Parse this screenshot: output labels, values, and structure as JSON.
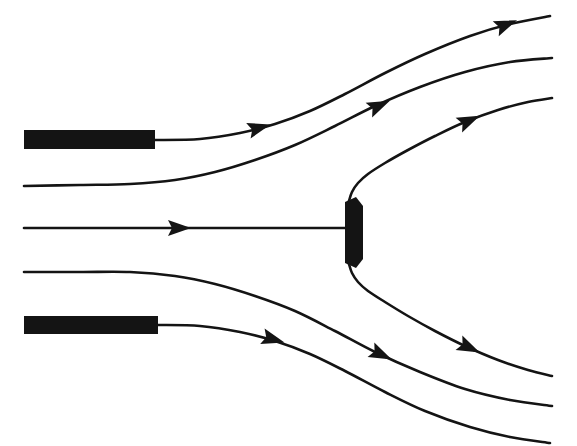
{
  "figure": {
    "background_color": "#ffffff",
    "ink_color": "#141414",
    "width": 577,
    "height": 446
  },
  "chart_data": {
    "type": "line",
    "subtitle": "",
    "xlabel": "",
    "ylabel": "",
    "xlim": [
      0,
      577
    ],
    "ylim": [
      0,
      446
    ],
    "grid": false,
    "legend": "none",
    "annotations": [],
    "tick_labels": {
      "x": [],
      "y": []
    },
    "series": [
      {
        "name": "streamline-1-upper-outer",
        "stroke_width": 2.6,
        "points": [
          [
            155,
            140
          ],
          [
            200,
            139
          ],
          [
            240,
            133
          ],
          [
            275,
            124
          ],
          [
            310,
            111
          ],
          [
            345,
            94
          ],
          [
            385,
            73
          ],
          [
            425,
            54
          ],
          [
            470,
            36
          ],
          [
            510,
            24
          ],
          [
            550,
            16
          ]
        ],
        "arrowheads": [
          {
            "x": 258,
            "y": 128,
            "angle": -16
          },
          {
            "x": 505,
            "y": 25,
            "angle": -22
          }
        ]
      },
      {
        "name": "streamline-2-upper-inner",
        "stroke_width": 2.6,
        "points": [
          [
            24,
            186
          ],
          [
            80,
            185
          ],
          [
            130,
            184
          ],
          [
            175,
            180
          ],
          [
            215,
            172
          ],
          [
            255,
            160
          ],
          [
            295,
            145
          ],
          [
            335,
            126
          ],
          [
            375,
            106
          ],
          [
            420,
            87
          ],
          [
            465,
            72
          ],
          [
            510,
            62
          ],
          [
            552,
            58
          ]
        ],
        "arrowheads": [
          {
            "x": 378,
            "y": 106,
            "angle": -24
          }
        ]
      },
      {
        "name": "streamline-3-stagnation-upper-branch",
        "stroke_width": 2.6,
        "points": [
          [
            349,
            201
          ],
          [
            352,
            192
          ],
          [
            358,
            183
          ],
          [
            368,
            174
          ],
          [
            385,
            163
          ],
          [
            408,
            150
          ],
          [
            435,
            136
          ],
          [
            465,
            122
          ],
          [
            498,
            110
          ],
          [
            528,
            102
          ],
          [
            552,
            98
          ]
        ],
        "arrowheads": [
          {
            "x": 468,
            "y": 121,
            "angle": -24
          }
        ]
      },
      {
        "name": "streamline-4-stagnation-axis",
        "stroke_width": 2.6,
        "points": [
          [
            24,
            228
          ],
          [
            120,
            228
          ],
          [
            200,
            228
          ],
          [
            280,
            228
          ],
          [
            345,
            228
          ]
        ],
        "arrowheads": [
          {
            "x": 178,
            "y": 228,
            "angle": 0
          }
        ]
      },
      {
        "name": "streamline-5-stagnation-lower-branch",
        "stroke_width": 2.6,
        "points": [
          [
            349,
            264
          ],
          [
            352,
            273
          ],
          [
            358,
            282
          ],
          [
            368,
            291
          ],
          [
            385,
            302
          ],
          [
            408,
            316
          ],
          [
            435,
            331
          ],
          [
            465,
            346
          ],
          [
            498,
            360
          ],
          [
            528,
            370
          ],
          [
            552,
            376
          ]
        ],
        "arrowheads": [
          {
            "x": 468,
            "y": 347,
            "angle": 25
          }
        ]
      },
      {
        "name": "streamline-6-lower-inner",
        "stroke_width": 2.6,
        "points": [
          [
            24,
            272
          ],
          [
            80,
            272
          ],
          [
            130,
            272
          ],
          [
            175,
            276
          ],
          [
            215,
            284
          ],
          [
            255,
            296
          ],
          [
            295,
            311
          ],
          [
            335,
            331
          ],
          [
            375,
            352
          ],
          [
            420,
            372
          ],
          [
            465,
            389
          ],
          [
            510,
            400
          ],
          [
            552,
            406
          ]
        ],
        "arrowheads": [
          {
            "x": 380,
            "y": 354,
            "angle": 25
          }
        ]
      },
      {
        "name": "streamline-7-lower-outer",
        "stroke_width": 2.6,
        "points": [
          [
            158,
            325
          ],
          [
            200,
            326
          ],
          [
            240,
            332
          ],
          [
            275,
            341
          ],
          [
            310,
            354
          ],
          [
            345,
            371
          ],
          [
            385,
            392
          ],
          [
            425,
            411
          ],
          [
            470,
            427
          ],
          [
            510,
            437
          ],
          [
            550,
            443
          ]
        ],
        "arrowheads": [
          {
            "x": 272,
            "y": 339,
            "angle": 16
          }
        ]
      }
    ],
    "shapes": [
      {
        "name": "upper-plate",
        "kind": "rect",
        "x": 24,
        "y": 130,
        "width": 131,
        "height": 19
      },
      {
        "name": "lower-plate",
        "kind": "rect",
        "x": 24,
        "y": 316,
        "width": 134,
        "height": 18
      },
      {
        "name": "blunt-body",
        "kind": "polygon",
        "points": "345,202 356,197 363,206 363,259 356,268 345,263"
      }
    ]
  },
  "labels": {
    "figure_caption": "",
    "axis_note": ""
  }
}
